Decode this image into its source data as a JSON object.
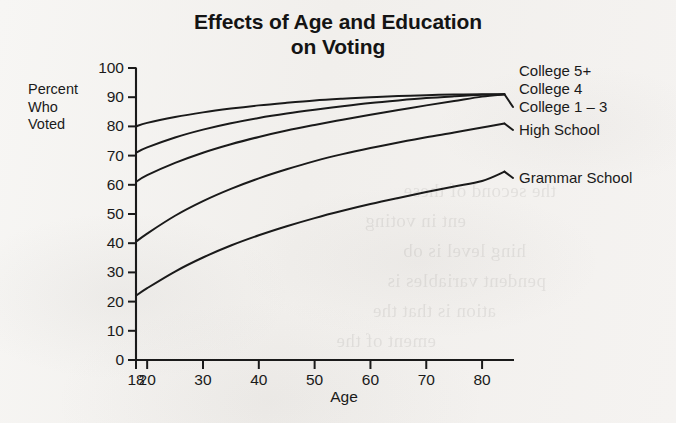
{
  "chart_data": {
    "type": "line",
    "title": "Effects of Age and Education on Voting",
    "title_line1": "Effects of Age and Education",
    "title_line2": "on Voting",
    "xlabel": "Age",
    "ylabel": "Percent Who Voted",
    "ylabel_lines": [
      "Percent",
      "Who",
      "Voted"
    ],
    "xlim": [
      18,
      85
    ],
    "ylim": [
      0,
      100
    ],
    "grid": false,
    "legend_position": "right-of-plot-end-labels",
    "x_ticks": [
      18,
      20,
      30,
      40,
      50,
      60,
      70,
      80
    ],
    "x_tick_labels": [
      "18",
      "20",
      "30",
      "40",
      "50",
      "60",
      "70",
      "80"
    ],
    "y_ticks": [
      0,
      10,
      20,
      30,
      40,
      50,
      60,
      70,
      80,
      90,
      100
    ],
    "y_tick_labels": [
      "0",
      "10",
      "20",
      "30",
      "40",
      "50",
      "60",
      "70",
      "80",
      "90",
      "100"
    ],
    "x": [
      18,
      20,
      25,
      30,
      35,
      40,
      45,
      50,
      55,
      60,
      65,
      70,
      75,
      80,
      84
    ],
    "series": [
      {
        "name": "College 5+",
        "label": "College 5+",
        "values": [
          80,
          81.2,
          83.2,
          84.8,
          86.1,
          87.2,
          88.1,
          88.9,
          89.5,
          90.0,
          90.4,
          90.7,
          90.9,
          91.0,
          91.0
        ]
      },
      {
        "name": "College 4",
        "label": "College 4",
        "values": [
          71,
          72.8,
          76.2,
          78.9,
          81.1,
          82.9,
          84.4,
          85.7,
          86.9,
          88.0,
          88.9,
          89.7,
          90.3,
          90.8,
          91.0
        ]
      },
      {
        "name": "College 1 – 3",
        "label": "College 1 – 3",
        "values": [
          61,
          63.3,
          67.5,
          71.0,
          73.9,
          76.4,
          78.6,
          80.5,
          82.3,
          84.0,
          85.6,
          87.2,
          88.7,
          90.2,
          91.0
        ]
      },
      {
        "name": "High School",
        "label": "High School",
        "values": [
          40.5,
          43.3,
          49.4,
          54.4,
          58.6,
          62.2,
          65.3,
          68.1,
          70.5,
          72.6,
          74.5,
          76.3,
          77.9,
          79.6,
          81.0
        ]
      },
      {
        "name": "Grammar School",
        "label": "Grammar School",
        "values": [
          22,
          24.6,
          30.3,
          35.1,
          39.2,
          42.7,
          45.8,
          48.6,
          51.1,
          53.4,
          55.5,
          57.5,
          59.4,
          61.3,
          64.5
        ]
      }
    ],
    "colors": {
      "line": "#1a1a1a",
      "axis": "#1a1a1a",
      "text": "#1a1a1a",
      "background": "#f4f2f0"
    },
    "end_labels": [
      {
        "text": "College 5+",
        "series": "College 5+"
      },
      {
        "text": "College 4",
        "series": "College 4"
      },
      {
        "text": "College 1 – 3",
        "series": "College 1 – 3"
      },
      {
        "text": "High School",
        "series": "High School"
      },
      {
        "text": "Grammar School",
        "series": "Grammar School"
      }
    ]
  },
  "bleed_through": [
    {
      "text": "the second of these",
      "left": 120,
      "top": 176
    },
    {
      "text": "ent in voting",
      "left": 210,
      "top": 206
    },
    {
      "text": "hing level is ob",
      "left": 150,
      "top": 236
    },
    {
      "text": "pendent variables is",
      "left": 130,
      "top": 266
    },
    {
      "text": "ation is that the",
      "left": 180,
      "top": 296
    },
    {
      "text": "ement of the",
      "left": 240,
      "top": 326
    }
  ]
}
